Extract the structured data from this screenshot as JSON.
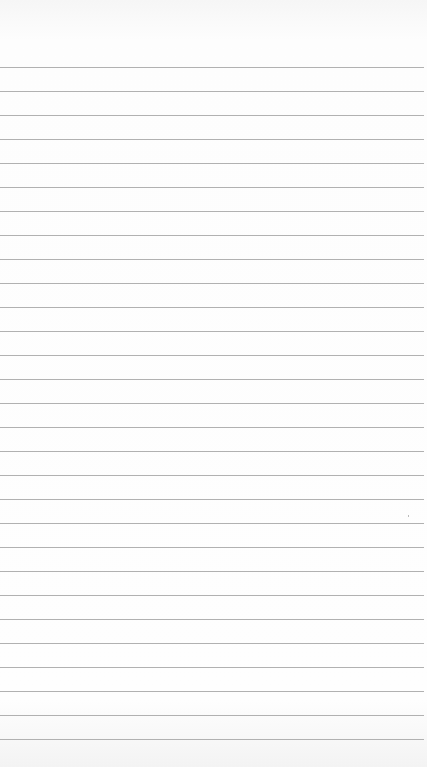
{
  "paper": {
    "type": "lined-paper",
    "background_color": "#fdfdfd",
    "rule_color": "#a9a9a9",
    "first_rule_y": 67,
    "rule_spacing": 24,
    "rule_count": 29
  }
}
